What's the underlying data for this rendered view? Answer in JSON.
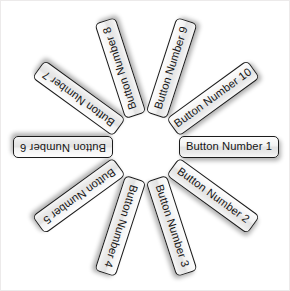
{
  "canvas": {
    "width": 290,
    "height": 291,
    "background_color": "#ffffff",
    "frame_color": "#eceaea"
  },
  "layout": {
    "type": "radial-wheel",
    "center_x": 145,
    "center_y": 146,
    "inner_radius": 33,
    "button_count": 10,
    "angle_step_degrees": 36,
    "start_angle_degrees": 0,
    "button_width": 100,
    "button_height": 22
  },
  "style": {
    "border_color": "#1c1c1c",
    "fill_top_color": "#fdfdfd",
    "fill_mid_color": "#e2e2e2",
    "fill_bottom_color": "#f6f6f6",
    "text_color": "#151515",
    "shadow_color": "rgba(0,0,0,0.30)"
  },
  "buttons": [
    {
      "id": 1,
      "label": "Button Number 1",
      "angle": 0,
      "upside_down": false
    },
    {
      "id": 2,
      "label": "Button Number 2",
      "angle": 36,
      "upside_down": false
    },
    {
      "id": 3,
      "label": "Button Number 3",
      "angle": 72,
      "upside_down": false
    },
    {
      "id": 4,
      "label": "Button Number 4",
      "angle": 108,
      "upside_down": true
    },
    {
      "id": 5,
      "label": "Button Number 5",
      "angle": 144,
      "upside_down": true
    },
    {
      "id": 6,
      "label": "Button Number 6",
      "angle": 180,
      "upside_down": true
    },
    {
      "id": 7,
      "label": "Button Number 7",
      "angle": 216,
      "upside_down": true
    },
    {
      "id": 8,
      "label": "Button Number 8",
      "angle": 252,
      "upside_down": true
    },
    {
      "id": 9,
      "label": "Button Number 9",
      "angle": 288,
      "upside_down": false
    },
    {
      "id": 10,
      "label": "Button Number 10",
      "angle": 324,
      "upside_down": false
    }
  ]
}
